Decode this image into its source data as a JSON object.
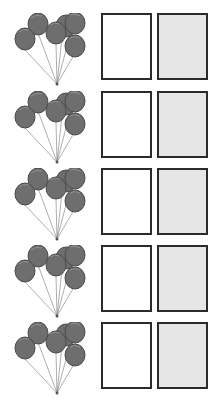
{
  "worksheet": {
    "rows": [
      {
        "balloon_count": 6,
        "boxes": [
          "blank",
          "shaded"
        ]
      },
      {
        "balloon_count": 6,
        "boxes": [
          "blank",
          "shaded"
        ]
      },
      {
        "balloon_count": 6,
        "boxes": [
          "blank",
          "shaded"
        ]
      },
      {
        "balloon_count": 6,
        "boxes": [
          "blank",
          "shaded"
        ]
      },
      {
        "balloon_count": 6,
        "boxes": [
          "blank",
          "shaded"
        ]
      }
    ],
    "colors": {
      "balloon_fill": "#6e6e6e",
      "balloon_stroke": "#4a4a4a",
      "box_border": "#2b2b2b",
      "box_blank": "#ffffff",
      "box_shaded": "#e6e6e6"
    },
    "icons": {
      "balloon": "balloon-bunch-icon"
    }
  }
}
